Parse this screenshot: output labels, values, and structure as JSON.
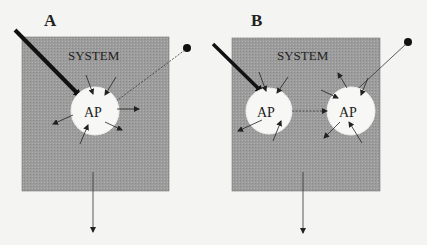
{
  "figure": {
    "panels": [
      {
        "id": "A",
        "letter": "A",
        "system_label": "SYSTEM",
        "nodes": [
          {
            "label": "AP"
          }
        ],
        "description": "Single AP within system; strong input arrow, external dot source, inward and outward arrows, downward output"
      },
      {
        "id": "B",
        "letter": "B",
        "system_label": "SYSTEM",
        "nodes": [
          {
            "label": "AP"
          },
          {
            "label": "AP"
          }
        ],
        "description": "Two APs within system connected by dotted arrow; strong input to left AP, external dot source to right AP, downward output"
      }
    ],
    "colors": {
      "background": "#f4f4f2",
      "system_fill": "#9a9a9a",
      "node_fill": "#f7f7f5",
      "stroke": "#222222"
    }
  }
}
